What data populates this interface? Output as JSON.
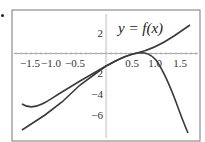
{
  "chart_data": {
    "type": "line",
    "title": "",
    "annotation": "y = f(x)",
    "xlabel": "",
    "ylabel": "",
    "xlim": [
      -1.9,
      1.9
    ],
    "ylim": [
      -8,
      3.5
    ],
    "grid": false,
    "x_ticks": [
      "-1.5",
      "-1.0",
      "-0.5",
      "0.5",
      "1.0",
      "1.5"
    ],
    "y_ticks": [
      "2",
      "-2",
      "-4",
      "-6"
    ],
    "series": [
      {
        "name": "f(x)",
        "x": [
          -1.7,
          -1.5,
          -1.3,
          -1.0,
          -0.5,
          0.0,
          0.5,
          0.7,
          1.0,
          1.2,
          1.4,
          1.65
        ],
        "y": [
          -4.8,
          -5.2,
          -4.9,
          -4.1,
          -2.6,
          -1.2,
          -0.05,
          0.05,
          -0.6,
          -2.5,
          -4.7,
          -7.5
        ]
      },
      {
        "name": "approximation",
        "x": [
          -1.7,
          -1.0,
          -0.5,
          0.0,
          0.5,
          0.7,
          1.0,
          1.5,
          1.7
        ],
        "y": [
          -7.3,
          -4.3,
          -2.6,
          -1.2,
          -0.05,
          0.1,
          0.7,
          2.0,
          2.7
        ]
      }
    ]
  },
  "labels": {
    "function": "y = f(x)",
    "x_ticks": [
      {
        "text": "−1.5",
        "x": 30
      },
      {
        "text": "−1.0",
        "x": 51
      },
      {
        "text": "−0.5",
        "x": 75
      },
      {
        "text": "0.5",
        "x": 132
      },
      {
        "text": "1.0",
        "x": 155
      },
      {
        "text": "1.5",
        "x": 180
      }
    ],
    "y_ticks": [
      {
        "text": "2",
        "y": 37
      },
      {
        "text": "−2",
        "y": 77
      },
      {
        "text": "−4",
        "y": 98
      },
      {
        "text": "−6",
        "y": 119
      }
    ]
  },
  "paths": {
    "curve_f": "M22,104 C28,108 34,108 42,104 S55,96 62,92 L80,81 L106,66 C118,60 126,55 137,53 C146,52 150,54 156,60 C163,70 170,86 176,102 C181,116 185,126 188,133",
    "curve_line": "M22,130 L45,115 L62,102 L80,85 L106,66 C118,59 126,55 137,53 C150,50 162,44 174,36 L190,25"
  },
  "colors": {
    "curve": "#3a3a3a",
    "axis": "#999999",
    "frame": "#777777"
  }
}
